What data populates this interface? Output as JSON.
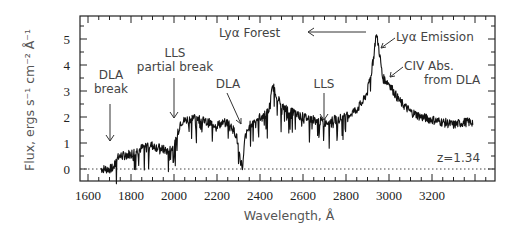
{
  "chart_data": {
    "type": "line",
    "title": "",
    "xlabel": "Wavelength, Å",
    "ylabel": "Flux, ergs s⁻¹ cm⁻² Å⁻¹",
    "xlim": [
      1530,
      3500
    ],
    "ylim": [
      -0.45,
      5.9
    ],
    "x_ticks": [
      1600,
      1800,
      2000,
      2200,
      2400,
      2600,
      2800,
      3000,
      3200
    ],
    "y_ticks": [
      0,
      1,
      2,
      3,
      4,
      5
    ],
    "grid": false,
    "zero_line": "dotted",
    "series": [
      {
        "name": "QSO spectrum",
        "x": [
          1660,
          1700,
          1720,
          1740,
          1760,
          1800,
          1850,
          1880,
          1900,
          1950,
          1970,
          2000,
          2010,
          2030,
          2060,
          2100,
          2150,
          2200,
          2250,
          2270,
          2290,
          2310,
          2320,
          2330,
          2360,
          2400,
          2440,
          2460,
          2480,
          2500,
          2550,
          2600,
          2650,
          2700,
          2750,
          2800,
          2850,
          2880,
          2900,
          2920,
          2930,
          2940,
          2950,
          2960,
          2970,
          2985,
          3000,
          3020,
          3050,
          3100,
          3150,
          3200,
          3250,
          3300,
          3350,
          3390
        ],
        "values": [
          0.0,
          0.0,
          0.05,
          0.5,
          0.5,
          0.6,
          0.8,
          0.95,
          0.9,
          0.75,
          0.7,
          0.85,
          1.1,
          1.8,
          1.9,
          2.0,
          1.8,
          1.7,
          1.8,
          1.6,
          1.3,
          0.3,
          0.05,
          1.2,
          1.8,
          2.0,
          2.2,
          3.2,
          2.8,
          2.4,
          2.2,
          2.0,
          1.9,
          1.8,
          1.9,
          2.0,
          2.3,
          2.6,
          3.0,
          3.8,
          4.4,
          5.2,
          4.8,
          4.2,
          3.5,
          3.4,
          3.3,
          3.0,
          2.6,
          2.2,
          2.0,
          1.9,
          1.8,
          1.7,
          1.8,
          1.8
        ]
      }
    ],
    "annotations": [
      {
        "text": "DLA break",
        "x": 1720,
        "arrow_to_flux": 0.6
      },
      {
        "text": "LLS partial break",
        "x": 2000,
        "arrow_to_flux": 1.9
      },
      {
        "text": "DLA",
        "x": 2320,
        "arrow_to_flux": 1.8
      },
      {
        "text": "LLS",
        "x": 2700,
        "arrow_to_flux": 1.9
      },
      {
        "text": "Lyα Forest",
        "direction": "arrow pointing to shorter wavelengths"
      },
      {
        "text": "Lyα Emission",
        "x": 2950
      },
      {
        "text": "CIV Abs. from DLA",
        "x": 2990
      },
      {
        "text": "z=1.34"
      }
    ]
  },
  "labels": {
    "xlabel": "Wavelength, Å",
    "ylabel": "Flux, ergs s⁻¹ cm⁻² Å⁻¹",
    "dla_break_1": "DLA",
    "dla_break_2": "break",
    "lls_partial_1": "LLS",
    "lls_partial_2": "partial break",
    "dla": "DLA",
    "lls": "LLS",
    "lya_forest": "Lyα Forest",
    "lya_emission": "Lyα Emission",
    "civ_1": "CIV Abs.",
    "civ_2": "from DLA",
    "redshift": "z=1.34"
  }
}
